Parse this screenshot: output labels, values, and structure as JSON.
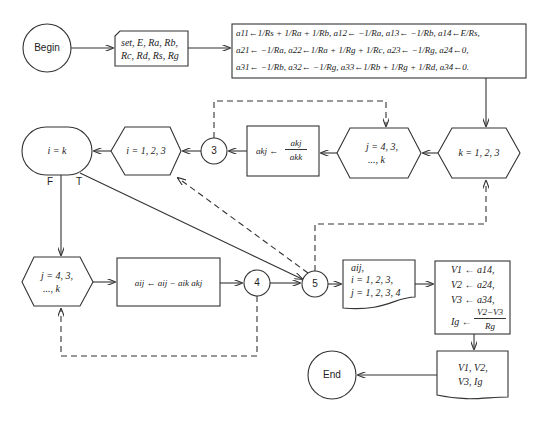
{
  "nodes": {
    "begin": {
      "label": "Begin",
      "shape": "terminal-circle"
    },
    "input": {
      "line1": "set, E, Ra, Rb,",
      "line2": "Rc, Rd, Rs, Rg",
      "shape": "card"
    },
    "assign": {
      "shape": "process",
      "line1": "a11←1/Rs + 1/Ra + 1/Rb, a12← −1/Ra, a13← −1/Rb, a14←E/Rs,",
      "line2": "a21← −1/Ra, a22←1/Ra + 1/Rg + 1/Rc, a23← −1/Rg, a24←0,",
      "line3": "a31← −1/Rb, a32← −1/Rg, a33←1/Rb + 1/Rg + 1/Rd, a34←0."
    },
    "loop_k": {
      "label": "k = 1, 2, 3",
      "shape": "loop-hexagon"
    },
    "loop_j1": {
      "line1": "j = 4, 3,",
      "line2": "..., k",
      "shape": "loop-hexagon"
    },
    "normalize": {
      "lhs": "akj ←",
      "num": "akj",
      "den": "akk",
      "shape": "process"
    },
    "connector3": {
      "label": "3",
      "shape": "connector"
    },
    "loop_i": {
      "label": "i = 1, 2, 3",
      "shape": "loop-hexagon"
    },
    "decision": {
      "label": "i = k",
      "shape": "decision-oval",
      "false_label": "F",
      "true_label": "T"
    },
    "loop_j2": {
      "line1": "j = 4, 3,",
      "line2": "..., k",
      "shape": "loop-hexagon"
    },
    "eliminate": {
      "label": "aij ← aij − aik akj",
      "shape": "process"
    },
    "connector4": {
      "label": "4",
      "shape": "connector"
    },
    "connector5": {
      "label": "5",
      "shape": "connector"
    },
    "output_matrix": {
      "line1": "aij,",
      "line2": "i = 1, 2, 3,",
      "line3": "j = 1, 2, 3, 4",
      "shape": "document"
    },
    "compute": {
      "line1": "V1 ← a14,",
      "line2": "V2 ← a24,",
      "line3": "V3 ← a34,",
      "lhs": "Ig ←",
      "num": "V2−V3",
      "den": "Rg",
      "shape": "process"
    },
    "output_result": {
      "line1": "V1, V2,",
      "line2": "V3, Ig",
      "shape": "document"
    },
    "end": {
      "label": "End",
      "shape": "terminal-circle"
    }
  },
  "colors": {
    "stroke": "#333333",
    "background": "#ffffff"
  }
}
